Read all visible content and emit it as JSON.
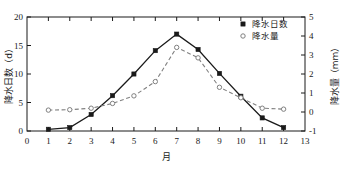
{
  "chart_data": {
    "type": "line",
    "title": "",
    "xlabel": "月",
    "ylabel": "降水日数（d）",
    "y2label": "降水量（mm）",
    "x": [
      1,
      2,
      3,
      4,
      5,
      6,
      7,
      8,
      9,
      10,
      11,
      12
    ],
    "xlim": [
      0,
      13
    ],
    "ylim": [
      0,
      20
    ],
    "y2lim": [
      -1,
      5
    ],
    "xticks": [
      "0",
      "1",
      "2",
      "3",
      "4",
      "5",
      "6",
      "7",
      "8",
      "9",
      "10",
      "11",
      "12",
      "13"
    ],
    "yticks": [
      "0",
      "5",
      "10",
      "15",
      "20"
    ],
    "y2ticks": [
      "-1",
      "0",
      "1",
      "2",
      "3",
      "4",
      "5"
    ],
    "grid": false,
    "legend_position": "top-right",
    "series": [
      {
        "name": "降水日数",
        "axis": "left",
        "marker": "filled-square",
        "linestyle": "solid",
        "color": "#1a1a1a",
        "values": [
          0.3,
          0.6,
          2.9,
          6.2,
          10.0,
          14.1,
          17.0,
          14.3,
          10.1,
          6.1,
          2.3,
          0.6
        ]
      },
      {
        "name": "降水量",
        "axis": "right",
        "marker": "open-circle",
        "linestyle": "dashed",
        "color": "#808080",
        "values": [
          0.1,
          0.12,
          0.2,
          0.45,
          0.85,
          1.6,
          3.4,
          2.85,
          1.3,
          0.75,
          0.2,
          0.15
        ]
      }
    ]
  },
  "legend": {
    "items": [
      {
        "label": "降水日数",
        "marker": "filled-square"
      },
      {
        "label": "降水量",
        "marker": "open-circle"
      }
    ]
  }
}
